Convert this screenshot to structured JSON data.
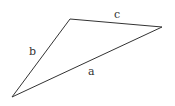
{
  "diagram": {
    "type": "triangle",
    "stroke_color": "#333333",
    "vertices": {
      "top": [
        70,
        19
      ],
      "right": [
        162,
        27
      ],
      "bottom_left": [
        12,
        97
      ]
    },
    "sides": [
      {
        "id": "a",
        "label": "a",
        "from": "bottom_left",
        "to": "right"
      },
      {
        "id": "b",
        "label": "b",
        "from": "bottom_left",
        "to": "top"
      },
      {
        "id": "c",
        "label": "c",
        "from": "top",
        "to": "right"
      }
    ]
  }
}
